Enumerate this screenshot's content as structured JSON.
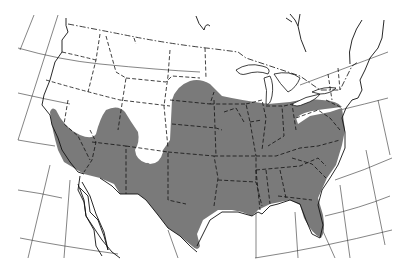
{
  "map": {
    "type": "range-map",
    "region": "Contiguous United States with southern Canada and northern Mexico",
    "projection": "conic with curved graticule",
    "shaded_region_label": "range",
    "colors": {
      "range_fill": "#7a7a7a",
      "background": "#ffffff",
      "lines": "#111111"
    },
    "features": [
      "graticule",
      "coastline",
      "state-boundaries-dashed",
      "international-boundaries",
      "great-lakes",
      "baja-california"
    ]
  }
}
